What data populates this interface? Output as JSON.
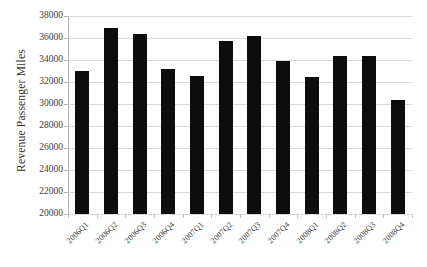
{
  "chart_data": {
    "type": "bar",
    "title": "",
    "xlabel": "",
    "ylabel": "Revenue Passenger Miles",
    "ylim": [
      20000,
      38000
    ],
    "ytick_step": 2000,
    "yticks": [
      20000,
      22000,
      24000,
      26000,
      28000,
      30000,
      32000,
      34000,
      36000,
      38000
    ],
    "ytick_labels": [
      "20000",
      "22000",
      "24000",
      "26000",
      "28000",
      "30000",
      "32000",
      "34000",
      "36000",
      "38000"
    ],
    "grid": true,
    "legend": "none",
    "bar_color": "#0d0d0d",
    "categories": [
      "2006Q1",
      "2006Q2",
      "2006Q3",
      "2006Q4",
      "2007Q1",
      "2007Q2",
      "2007Q3",
      "2007Q4",
      "2008Q1",
      "2008Q2",
      "2008Q3",
      "2008Q4"
    ],
    "values": [
      33000,
      36900,
      36350,
      33150,
      32550,
      35750,
      36200,
      33950,
      32450,
      34350,
      34400,
      30400
    ]
  },
  "axis": {
    "y_title": "Revenue Passenger Miles"
  }
}
